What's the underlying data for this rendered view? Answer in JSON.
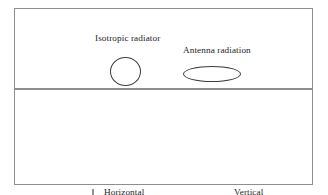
{
  "figure": {
    "panels": [
      {
        "id": "top",
        "labels": [
          {
            "text": "Isotropic radiator"
          },
          {
            "text": "Antenna radiation"
          }
        ],
        "shapes": [
          {
            "name": "isotropic-pattern-circle",
            "kind": "circle"
          },
          {
            "name": "antenna-pattern-ellipse",
            "kind": "ellipse-horizontal"
          }
        ]
      },
      {
        "id": "bottom",
        "labels": [
          {
            "text": "Horizontal"
          },
          {
            "text": "Vertical"
          }
        ],
        "shapes": [
          {
            "name": "horizontal-source-circle",
            "kind": "circle"
          },
          {
            "name": "horizontal-pattern-ellipse",
            "kind": "ellipse-horizontal"
          },
          {
            "name": "vertical-source-circle",
            "kind": "circle"
          },
          {
            "name": "vertical-pattern-ellipse",
            "kind": "ellipse-vertical"
          }
        ],
        "arrows": [
          {
            "name": "down-arrow",
            "direction": "down"
          },
          {
            "name": "right-arrow",
            "direction": "right"
          }
        ]
      }
    ],
    "colors": {
      "frame": "#8e8e8e",
      "shape_outline": "#3c3c3c",
      "arrow": "#262626",
      "text": "#1d1d1d",
      "background": "#ffffff"
    }
  }
}
